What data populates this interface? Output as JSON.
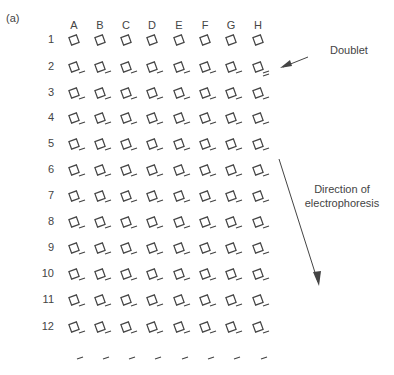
{
  "panel_label": "(a)",
  "columns": [
    "A",
    "B",
    "C",
    "D",
    "E",
    "F",
    "G",
    "H"
  ],
  "rows": [
    "1",
    "2",
    "3",
    "4",
    "5",
    "6",
    "7",
    "8",
    "9",
    "10",
    "11",
    "12"
  ],
  "annotations": {
    "doublet": "Doublet",
    "direction_line1": "Direction of",
    "direction_line2": "electrophoresis"
  },
  "layout": {
    "col_x": [
      74,
      100,
      126,
      152,
      179,
      205,
      231,
      258
    ],
    "row_y": [
      40,
      67,
      93,
      118,
      144,
      170,
      196,
      222,
      248,
      274,
      300,
      327
    ],
    "trailing_y": 357,
    "color": "#444444"
  }
}
